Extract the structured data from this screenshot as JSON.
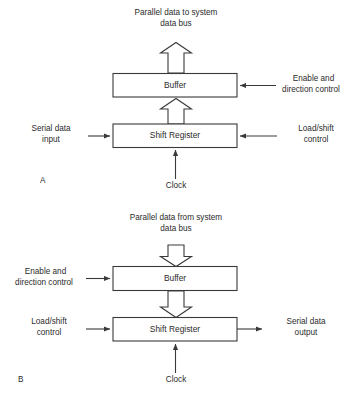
{
  "figure": {
    "title_visible": false,
    "background_color": "#ffffff",
    "line_color": "#3a3a3a",
    "text_color": "#2b2b2b"
  },
  "panels": [
    {
      "letter": "A",
      "description": "Serial-in / parallel-out shift register to system data bus",
      "blocks": [
        {
          "name": "buffer",
          "label": "Buffer"
        },
        {
          "name": "shift-register",
          "label": "Shift Register"
        }
      ],
      "labels": {
        "top_bus": "Parallel data to system\ndata bus",
        "top_bus_line1": "Parallel data to system",
        "top_bus_line2": "data bus",
        "right_buffer_line1": "Enable and",
        "right_buffer_line2": "direction control",
        "left_shift_line1": "Serial data",
        "left_shift_line2": "input",
        "right_shift_line1": "Load/shift",
        "right_shift_line2": "control",
        "clock": "Clock"
      }
    },
    {
      "letter": "B",
      "description": "Parallel-in / serial-out shift register from system data bus",
      "blocks": [
        {
          "name": "buffer",
          "label": "Buffer"
        },
        {
          "name": "shift-register",
          "label": "Shift Register"
        }
      ],
      "labels": {
        "top_bus": "Parallel data from system\ndata bus",
        "top_bus_line1": "Parallel data from system",
        "top_bus_line2": "data bus",
        "left_buffer_line1": "Enable and",
        "left_buffer_line2": "direction control",
        "left_shift_line1": "Load/shift",
        "left_shift_line2": "control",
        "right_shift_line1": "Serial data",
        "right_shift_line2": "output",
        "clock": "Clock"
      }
    }
  ]
}
